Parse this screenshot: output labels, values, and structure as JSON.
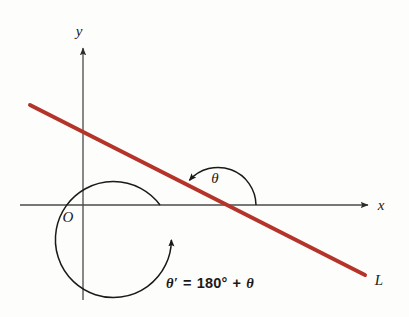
{
  "figure": {
    "background_color": "#fdfdfb"
  },
  "colors": {
    "line": "#b5342a",
    "axis": "#4a4a4a",
    "arc": "#1a1a1a",
    "text": "#1a1a1a"
  },
  "axes": {
    "x_label": "x",
    "y_label": "y",
    "origin_label": "O",
    "x_axis_y": 205,
    "y_axis_x": 83,
    "x_start": 20,
    "x_end": 372,
    "y_start": 45,
    "y_end": 300
  },
  "line": {
    "label": "L",
    "color": "#b5342a",
    "x1": 30,
    "y1": 105,
    "x2": 365,
    "y2": 275,
    "width": 4
  },
  "angles": {
    "center_x": 218,
    "center_y": 205,
    "inner": {
      "label": "θ",
      "radius": 38,
      "label_x": 215,
      "label_y": 182
    },
    "outer": {
      "radius": 58
    }
  },
  "equation": {
    "theta_prime": "θ′",
    "equals": "=",
    "value": "180°",
    "plus": "+",
    "theta": "θ",
    "full_text": "θ′ = 180° + θ",
    "x": 210,
    "y": 285
  }
}
